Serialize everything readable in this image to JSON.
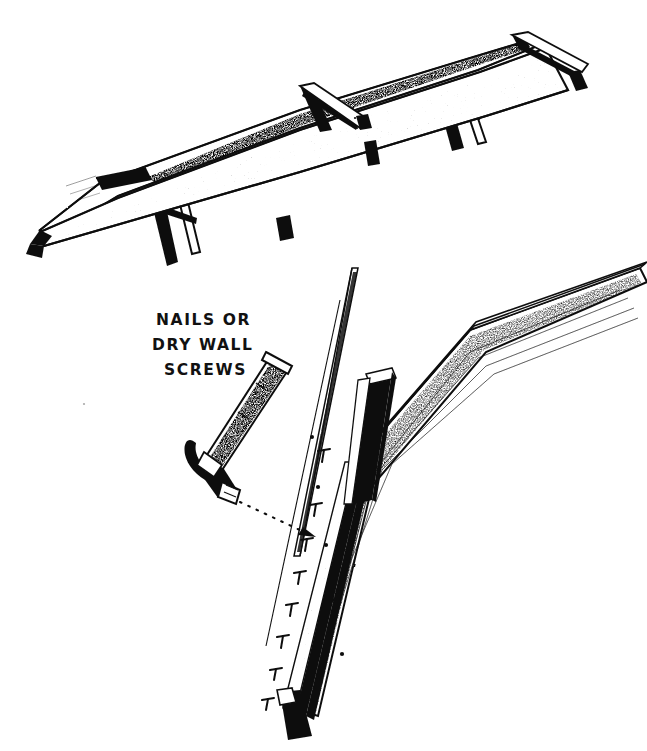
{
  "document": {
    "kind": "scanned-pen-and-ink-illustration",
    "subject": "tapered wooden beam on sawhorses with nailing detail",
    "background_color": "#ffffff",
    "ink_color": "#111111"
  },
  "annotation": {
    "lines": [
      "NAILS OR",
      "DRY WALL",
      "SCREWS"
    ],
    "line1": "NAILS OR",
    "line2": "DRY WALL",
    "line3": "SCREWS"
  },
  "figures": {
    "top": {
      "name": "beam-on-sawhorses",
      "elements": [
        "tapered-beam",
        "sawhorse-left",
        "sawhorse-right",
        "end-cleat-left",
        "end-cleat-right",
        "triangular-brace"
      ]
    },
    "bottom": {
      "name": "nailing-detail",
      "elements": [
        "board-edge",
        "dark-cleat-batten",
        "thin-guide-board",
        "claw-hammer",
        "dotted-leader-arrow",
        "nail-tick-marks"
      ],
      "nail_tick_count": 8
    }
  }
}
